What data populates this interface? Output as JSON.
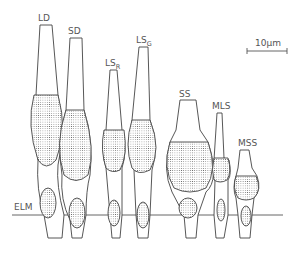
{
  "figure": {
    "type": "photoreceptor cell diagram",
    "scale_bar": {
      "label": "10µm"
    },
    "membrane_label": "ELM",
    "cells": [
      {
        "id": "LD",
        "label": "LD",
        "sub": ""
      },
      {
        "id": "SD",
        "label": "SD",
        "sub": ""
      },
      {
        "id": "LSR",
        "label": "LS",
        "sub": "R"
      },
      {
        "id": "LSG",
        "label": "LS",
        "sub": "G"
      },
      {
        "id": "SS",
        "label": "SS",
        "sub": ""
      },
      {
        "id": "MLS",
        "label": "MLS",
        "sub": ""
      },
      {
        "id": "MSS",
        "label": "MSS",
        "sub": ""
      }
    ]
  }
}
